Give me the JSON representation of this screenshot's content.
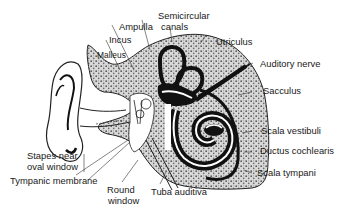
{
  "diagram": {
    "type": "anatomical-labeled-illustration",
    "colors": {
      "ink": "#111111",
      "bone_stipple": "#9a9a9a",
      "background": "#ffffff"
    },
    "labels": {
      "ampulla": "Ampulla",
      "semicircular_line1": "Semicircular",
      "semicircular_line2": "canals",
      "incus": "Incus",
      "malleus": "Malleus",
      "utriculus": "Utriculus",
      "auditory_nerve": "Auditory nerve",
      "sacculus": "Sacculus",
      "scala_vestibuli": "Scala vestibuli",
      "ductus_cochlearis": "Ductus cochlearis",
      "scala_tympani": "Scala tympani",
      "stapes_line1": "Stapes near",
      "stapes_line2": "oval window",
      "tympanic_membrane": "Tympanic membrane",
      "round_window_line1": "Round",
      "round_window_line2": "window",
      "tuba_auditiva": "Tuba auditiva"
    }
  }
}
